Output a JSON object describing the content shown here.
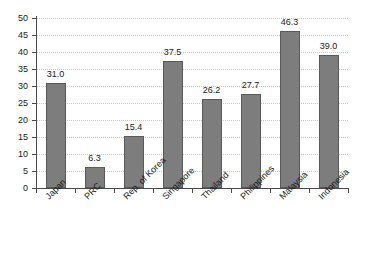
{
  "chart_data": {
    "type": "bar",
    "title": "",
    "subtitle": "",
    "xlabel": "",
    "ylabel": "",
    "categories": [
      "Japan",
      "PRC",
      "Rep. of Korea",
      "Singapore",
      "Thailand",
      "Philippines",
      "Malaysia",
      "Indonesia"
    ],
    "values": [
      31.0,
      6.3,
      15.4,
      37.5,
      26.2,
      27.7,
      46.3,
      39.0
    ],
    "value_labels": [
      "31.0",
      "6.3",
      "15.4",
      "37.5",
      "26.2",
      "27.7",
      "46.3",
      "39.0"
    ],
    "ylim": [
      0,
      50
    ],
    "ytick_step": 5,
    "ytick_labels": [
      "0",
      "5",
      "10",
      "15",
      "20",
      "25",
      "30",
      "35",
      "40",
      "45",
      "50"
    ],
    "ytick_values": [
      0,
      5,
      10,
      15,
      20,
      25,
      30,
      35,
      40,
      45,
      50
    ],
    "grid": true,
    "grid_axis": "y",
    "grid_style": "dotted",
    "legend": false,
    "legend_position": "none",
    "bar_color": "#7d7d7d",
    "bar_border_color": "#5a5a5a",
    "grid_color": "#c9c9c9",
    "axis_color": "#4a4a4a",
    "text_color": "#1a1a1a",
    "background_color": "#ffffff",
    "xtick_label_rotation": -45
  }
}
